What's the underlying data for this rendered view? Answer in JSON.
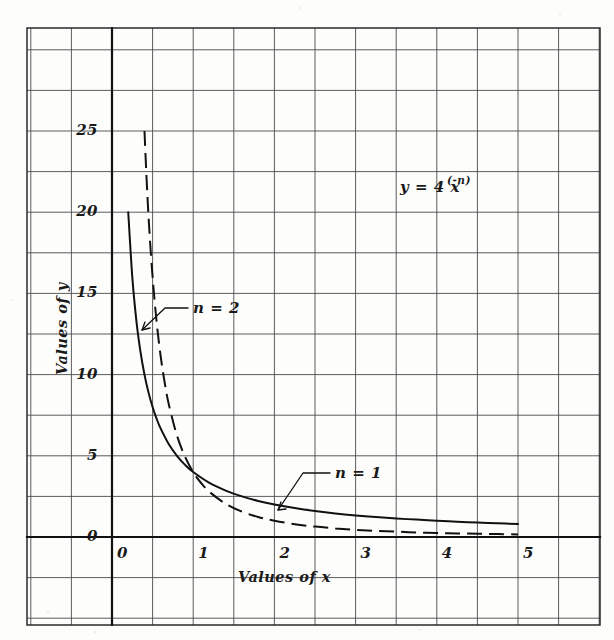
{
  "figure": {
    "kind": "hand-drawn-graph-on-grid-paper",
    "background_color": "#fdfdfc",
    "grid_color": "#4a4a4a",
    "ink_color": "#111111"
  },
  "chart_data": {
    "type": "line",
    "title": "",
    "subtitle": "",
    "equation": "y = 4 x",
    "equation_exponent": "(-n)",
    "xlabel": "Values of x",
    "ylabel": "Values of y",
    "xlim": [
      -0.5,
      6.0
    ],
    "ylim": [
      -3.0,
      30.0
    ],
    "xticks": [
      "0",
      "1",
      "2",
      "3",
      "4",
      "5"
    ],
    "xtick_values": [
      0,
      1,
      2,
      3,
      4,
      5
    ],
    "yticks": [
      "0",
      "5",
      "10",
      "15",
      "20",
      "25"
    ],
    "ytick_values": [
      0,
      5,
      10,
      15,
      20,
      25
    ],
    "grid": true,
    "grid_x_step": 0.5,
    "grid_y_step": 2.5,
    "legend": "inline-annotations",
    "annotations": [
      {
        "text": "n = 2",
        "x": 1.05,
        "y": 13.6,
        "points_to": {
          "x": 0.56,
          "y": 12.0
        }
      },
      {
        "text": "n = 1",
        "x": 2.88,
        "y": 3.35,
        "points_to": {
          "x": 2.32,
          "y": 1.72
        }
      }
    ],
    "series": [
      {
        "name": "n = 1",
        "style": "solid",
        "formula": "y = 4/x",
        "x": [
          0.2,
          0.25,
          0.3,
          0.35,
          0.4,
          0.45,
          0.5,
          0.55,
          0.6,
          0.7,
          0.8,
          0.9,
          1.0,
          1.2,
          1.4,
          1.6,
          1.8,
          2.0,
          2.25,
          2.5,
          2.75,
          3.0,
          3.25,
          3.5,
          3.75,
          4.0,
          4.25,
          4.5,
          4.75,
          5.0
        ],
        "y": [
          20.0,
          16.0,
          13.33,
          11.43,
          10.0,
          8.89,
          8.0,
          7.27,
          6.67,
          5.71,
          5.0,
          4.44,
          4.0,
          3.33,
          2.86,
          2.5,
          2.22,
          2.0,
          1.78,
          1.6,
          1.45,
          1.33,
          1.23,
          1.14,
          1.07,
          1.0,
          0.94,
          0.89,
          0.84,
          0.8
        ]
      },
      {
        "name": "n = 2",
        "style": "dashed",
        "formula": "y = 4/x^2",
        "x": [
          0.4,
          0.43,
          0.46,
          0.5,
          0.55,
          0.6,
          0.65,
          0.7,
          0.8,
          0.9,
          1.0,
          1.1,
          1.2,
          1.4,
          1.6,
          1.8,
          2.0,
          2.25,
          2.5,
          2.75,
          3.0,
          3.25,
          3.5,
          3.75,
          4.0,
          4.25,
          4.5,
          4.75,
          5.0
        ],
        "y": [
          25.0,
          21.63,
          18.9,
          16.0,
          13.22,
          11.11,
          9.47,
          8.16,
          6.25,
          4.94,
          4.0,
          3.31,
          2.78,
          2.04,
          1.56,
          1.23,
          1.0,
          0.79,
          0.64,
          0.53,
          0.44,
          0.38,
          0.33,
          0.28,
          0.25,
          0.22,
          0.2,
          0.18,
          0.16
        ]
      }
    ]
  }
}
